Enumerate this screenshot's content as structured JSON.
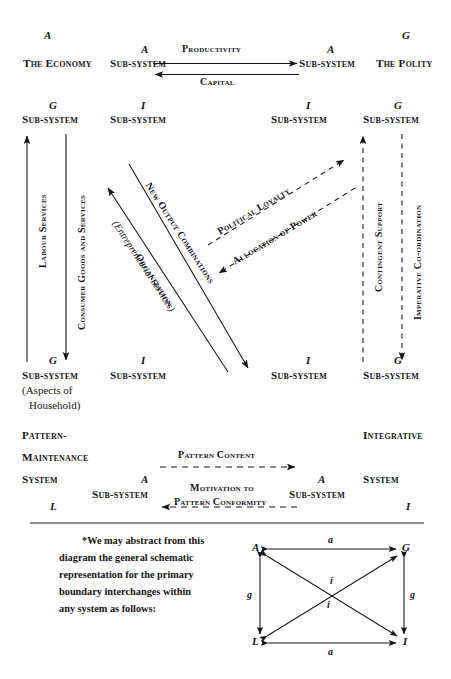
{
  "figure": {
    "type": "parsons-agil-interchange-diagram",
    "columns": {
      "outer_left": "The Economy",
      "inner_left": "Sub-system",
      "inner_right": "Sub-system",
      "outer_right": "The Polity"
    },
    "row1": {
      "outer_left_letter": "A",
      "inner_left_letter": "A",
      "inner_right_letter": "A",
      "outer_right_letter": "G",
      "outer_left_label": "The Economy",
      "inner_left_label": "Sub-system",
      "inner_right_label": "Sub-system",
      "outer_right_label": "The Polity",
      "flow_top": "Productivity",
      "flow_bottom": "Capital"
    },
    "row2": {
      "outer_left_letter": "G",
      "inner_left_letter": "I",
      "inner_right_letter": "I",
      "outer_right_letter": "G",
      "outer_left_label": "Sub-system",
      "inner_left_label": "Sub-system",
      "inner_right_label": "Sub-system",
      "outer_right_label": "Sub-system"
    },
    "row3": {
      "outer_left_letter": "G",
      "inner_left_letter": "I",
      "inner_right_letter": "I",
      "outer_right_letter": "G",
      "outer_left_label": "Sub-system",
      "outer_left_sub_line1": "(Aspects of",
      "outer_left_sub_line2": "Household)",
      "inner_left_label": "Sub-system",
      "inner_right_label": "Sub-system",
      "outer_right_label": "Sub-system"
    },
    "row4": {
      "outer_left_line1": "Pattern-",
      "outer_left_line2": "Maintenance",
      "outer_left_line3": "System",
      "outer_right_line1": "Integrative",
      "outer_right_line3": "System",
      "inner_left_letter": "A",
      "inner_right_letter": "A",
      "inner_left_label": "Sub-system",
      "inner_right_label": "Sub-system",
      "outer_left_letter": "L",
      "outer_right_letter": "I",
      "flow_top": "Pattern Content",
      "flow_bottom_line1": "Motivation to",
      "flow_bottom_line2": "Pattern Conformity"
    },
    "vertical_flows": {
      "labour_services": "Labour Services",
      "consumer_goods": "Consumer Goods and Services",
      "contingent_support": "Contingent Support",
      "imperative_coordination": "Imperative Co-ordination"
    },
    "diagonal_flows": {
      "organization_line1": "Organization",
      "organization_line2": "(Entrepreneurial Services)",
      "new_output_combinations": "New Output Combinations",
      "political_loyalty": "Political Loyalty",
      "allocation_of_power": "Allocation of Power"
    }
  },
  "footnote": {
    "line1": "*We may abstract from this",
    "line2": "diagram the general schematic",
    "line3": "representation for the primary",
    "line4": "boundary interchanges within",
    "line5": "any system as follows:"
  },
  "agil_box": {
    "top_left": "A",
    "top_right": "G",
    "bottom_left": "L",
    "bottom_right": "I",
    "top_edge": "a",
    "bottom_edge": "a",
    "left_edge": "g",
    "right_edge": "g",
    "diagonal_upper": "i",
    "diagonal_lower": "i"
  },
  "colors": {
    "ink": "#141414",
    "paper": "#ffffff"
  }
}
